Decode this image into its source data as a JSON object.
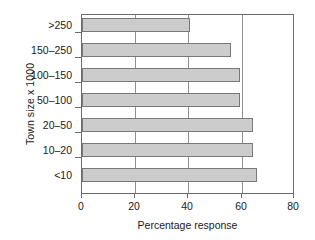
{
  "chart_data": {
    "type": "bar",
    "orientation": "horizontal",
    "title": "",
    "xlabel": "Percentage response",
    "ylabel": "Town size x 1000",
    "categories": [
      ">250",
      "150–250",
      "100–150",
      "50–100",
      "20–50",
      "10–20",
      "<10"
    ],
    "values": [
      41,
      56.5,
      60,
      60,
      65,
      65,
      66.5
    ],
    "xlim": [
      0,
      80
    ],
    "xticks": [
      0,
      20,
      40,
      60,
      80
    ],
    "xticklabels": [
      "0",
      "20",
      "40",
      "60",
      "80"
    ],
    "grid": "vertical-only",
    "legend": "none",
    "bar_color": "#cccccc",
    "bar_edge_color": "#787878",
    "axis_color": "#6b6b6b"
  }
}
